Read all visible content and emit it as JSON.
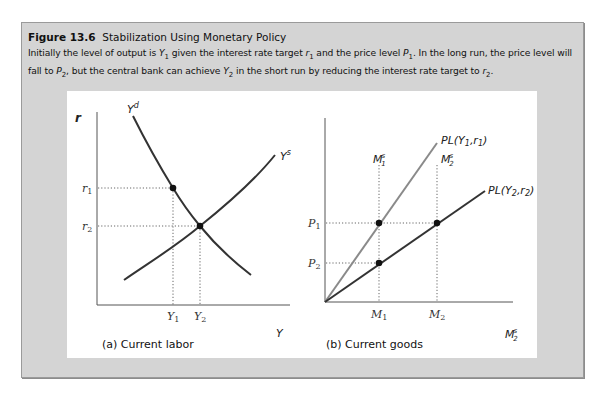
{
  "figure": {
    "number": "Figure 13.6",
    "title": "Stabilization Using Monetary Policy",
    "description_parts": [
      {
        "t": "Initially the level of output is "
      },
      {
        "t": "Y",
        "sub": "1"
      },
      {
        "t": " given the interest rate target "
      },
      {
        "t": "r",
        "sub": "1"
      },
      {
        "t": " and the price level "
      },
      {
        "t": "P",
        "sub": "1"
      },
      {
        "t": ". In the long run, the price level will fall to "
      },
      {
        "t": "P",
        "sub": "2"
      },
      {
        "t": ", but the central bank can achieve "
      },
      {
        "t": "Y",
        "sub": "2"
      },
      {
        "t": " in the short run by reducing the interest rate target to "
      },
      {
        "t": "r",
        "sub": "2"
      },
      {
        "t": "."
      }
    ]
  },
  "colors": {
    "frame_bg": "#d4d4d4",
    "curve_dark": "#333333",
    "curve_gray": "#8a8a8a",
    "guide": "#555555"
  },
  "chart_data": [
    {
      "type": "line",
      "title": "(a) Current labor",
      "xlabel": "Y",
      "ylabel": "r",
      "series": [
        {
          "name": "Y^d",
          "shape": "downward-sloping convex curve"
        },
        {
          "name": "Y^s",
          "shape": "upward-sloping curve"
        }
      ],
      "x_ticks": [
        "Y1",
        "Y2"
      ],
      "y_ticks": [
        "r1",
        "r2"
      ],
      "points": [
        {
          "label": "(Y1, r1)",
          "on": "Y^d"
        },
        {
          "label": "(Y2, r2)",
          "on": "Y^d ∩ Y^s"
        }
      ],
      "grid": false
    },
    {
      "type": "line",
      "title": "(b) Current goods",
      "xlabel": "M2^s",
      "ylabel": "",
      "series": [
        {
          "name": "PL(Y1,r1)",
          "shape": "ray from origin, steeper",
          "color": "#8a8a8a"
        },
        {
          "name": "PL(Y2,r2)",
          "shape": "ray from origin, flatter",
          "color": "#333333"
        }
      ],
      "x_ticks": [
        "M1",
        "M2"
      ],
      "y_ticks": [
        "P1",
        "P2"
      ],
      "vertical_guides": [
        "M1^s",
        "M2^s"
      ],
      "points": [
        {
          "label": "(M1, P1)",
          "on": "PL(Y1,r1)"
        },
        {
          "label": "(M1, P2)",
          "on": "PL(Y2,r2)"
        },
        {
          "label": "(M2, P1)",
          "on": "PL(Y2,r2)"
        }
      ],
      "grid": false
    }
  ],
  "panel_a": {
    "ylabel": "r",
    "xlabel": "Y",
    "yd_label": "Y",
    "yd_sup": "d",
    "ys_label": "Y",
    "ys_sup": "s",
    "r1": "r",
    "r1_sub": "1",
    "r2": "r",
    "r2_sub": "2",
    "y1": "Y",
    "y1_sub": "1",
    "y2": "Y",
    "y2_sub": "2",
    "caption": "(a) Current labor"
  },
  "panel_b": {
    "xlabel": "M",
    "xlabel_sub": "2",
    "xlabel_sup": "s",
    "p1": "P",
    "p1_sub": "1",
    "p2": "P",
    "p2_sub": "2",
    "m1": "M",
    "m1_sub": "1",
    "m2": "M",
    "m2_sub": "2",
    "m1s": "M",
    "m1s_sub": "1",
    "m1s_sup": "s",
    "m2s": "M",
    "m2s_sub": "2",
    "m2s_sup": "s",
    "pl1": "PL(Y",
    "pl1_sub": "1",
    "pl1_mid": ",r",
    "pl1_sub2": "1",
    "pl1_end": ")",
    "pl2": "PL(Y",
    "pl2_sub": "2",
    "pl2_mid": ",r",
    "pl2_sub2": "2",
    "pl2_end": ")",
    "caption": "(b) Current goods"
  }
}
